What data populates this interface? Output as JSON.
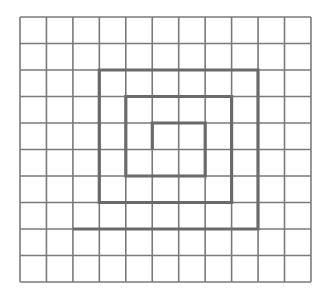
{
  "diagram": {
    "type": "grid-spiral",
    "grid": {
      "columns": 11,
      "rows": 10,
      "origin_x": 20,
      "origin_y": 17,
      "cell_w": 26.45,
      "cell_h": 26.5,
      "line_color": "#7a7a7a",
      "line_width": 1.6,
      "background": "#ffffff"
    },
    "spiral": {
      "color": "#6a6a6a",
      "line_width": 3.2,
      "points": [
        [
          5,
          5
        ],
        [
          5,
          4
        ],
        [
          7,
          4
        ],
        [
          7,
          6
        ],
        [
          4,
          6
        ],
        [
          4,
          3
        ],
        [
          8,
          3
        ],
        [
          8,
          7
        ],
        [
          3,
          7
        ],
        [
          3,
          2
        ],
        [
          9,
          2
        ],
        [
          9,
          8
        ],
        [
          2,
          8
        ]
      ]
    }
  }
}
